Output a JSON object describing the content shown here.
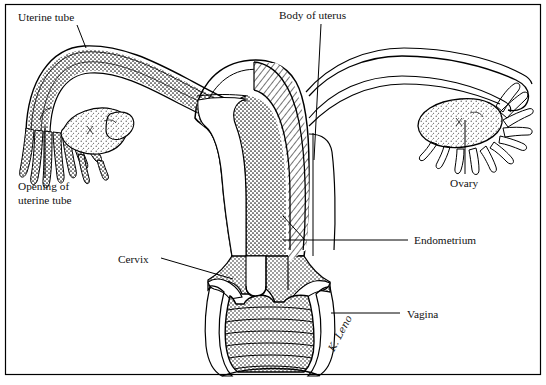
{
  "figure": {
    "signature": "K. Leno",
    "frame_color": "#000000",
    "ink_color": "#000000",
    "background_color": "#ffffff",
    "width": 546,
    "height": 385
  },
  "labels": [
    {
      "id": "uterine-tube",
      "text": "Uterine tube",
      "x": 18,
      "y": 20,
      "anchor": "start",
      "leader": "M 77 25 L 86 48"
    },
    {
      "id": "body-of-uterus",
      "text": "Body of uterus",
      "x": 279,
      "y": 18,
      "anchor": "start",
      "leader": "M 320 23 L 313 155"
    },
    {
      "id": "opening-of-uterine-tube",
      "text": "Opening of",
      "text2": "uterine tube",
      "x": 18,
      "y": 188,
      "anchor": "start",
      "leader": "M 45 180 L 45 126"
    },
    {
      "id": "ovary",
      "text": "Ovary",
      "x": 450,
      "y": 186,
      "anchor": "start",
      "leader": "M 465 176 L 465 120"
    },
    {
      "id": "endometrium",
      "text": "Endometrium",
      "x": 414,
      "y": 244,
      "anchor": "start",
      "leader": "M 408 240 L 287 240",
      "leader2": "M 287 240 L 281 218"
    },
    {
      "id": "cervix",
      "text": "Cervix",
      "x": 118,
      "y": 262,
      "anchor": "start",
      "leader": "M 160 258 L 232 279"
    },
    {
      "id": "vagina",
      "text": "Vagina",
      "x": 407,
      "y": 317,
      "anchor": "start",
      "leader": "M 400 313 L 330 313"
    }
  ],
  "structures": [
    {
      "id": "left-uterine-tube",
      "name": "Left uterine tube (cut away, stippled)"
    },
    {
      "id": "left-infundibulum-fimbriae",
      "name": "Left fimbriae"
    },
    {
      "id": "left-ovary",
      "name": "Left ovary (stippled)"
    },
    {
      "id": "uterus-body",
      "name": "Body of uterus"
    },
    {
      "id": "endometrium-layer",
      "name": "Endometrium (stippled inner layer)"
    },
    {
      "id": "myometrium-layer",
      "name": "Myometrium (diagonal hatched layer)"
    },
    {
      "id": "uterine-cavity",
      "name": "Uterine cavity"
    },
    {
      "id": "cervix-structure",
      "name": "Cervix"
    },
    {
      "id": "vagina-structure",
      "name": "Vagina with rugae"
    },
    {
      "id": "right-uterine-tube",
      "name": "Right uterine tube (outline)"
    },
    {
      "id": "right-ovary",
      "name": "Right ovary (stippled)"
    },
    {
      "id": "right-fimbriae",
      "name": "Right fimbriae"
    },
    {
      "id": "broad-ligament",
      "name": "Broad ligament"
    }
  ]
}
